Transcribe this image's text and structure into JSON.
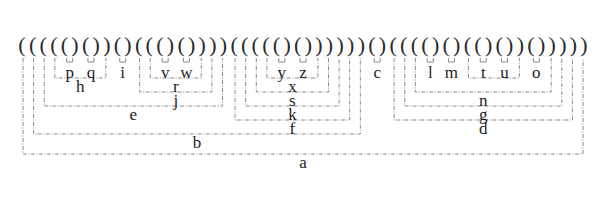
{
  "diagram": {
    "type": "parenthesized-tree-bracketing",
    "paren_string": "((((()())()((()())))((((()()))))))()((()()(()())(()))))",
    "leaves": [
      "p",
      "q",
      "i",
      "v",
      "w",
      "y",
      "z",
      "c",
      "l",
      "m",
      "t",
      "u",
      "o"
    ],
    "internal_nodes": [
      "h",
      "r",
      "j",
      "e",
      "x",
      "s",
      "k",
      "f",
      "b",
      "n",
      "g",
      "d",
      "a"
    ],
    "tree": {
      "label": "a",
      "children": [
        {
          "label": "b",
          "children": [
            {
              "label": "e",
              "children": [
                {
                  "label": "h",
                  "children": [
                    {
                      "label": "p"
                    },
                    {
                      "label": "q"
                    }
                  ]
                },
                {
                  "label": "i"
                },
                {
                  "label": "j",
                  "children": [
                    {
                      "label": "r",
                      "children": [
                        {
                          "label": "v"
                        },
                        {
                          "label": "w"
                        }
                      ]
                    }
                  ]
                }
              ]
            },
            {
              "label": "f",
              "children": [
                {
                  "label": "k",
                  "children": [
                    {
                      "label": "s",
                      "children": [
                        {
                          "label": "x",
                          "children": [
                            {
                              "label": "y"
                            },
                            {
                              "label": "z"
                            }
                          ]
                        }
                      ]
                    }
                  ]
                }
              ]
            }
          ]
        },
        {
          "label": "c"
        },
        {
          "label": "d",
          "children": [
            {
              "label": "g",
              "children": [
                {
                  "label": "n",
                  "children": [
                    {
                      "label": "l"
                    },
                    {
                      "label": "m"
                    },
                    {
                      "label": "t_u_group",
                      "hidden": true,
                      "children": [
                        {
                          "label": "t"
                        },
                        {
                          "label": "u"
                        }
                      ]
                    },
                    {
                      "label": "o"
                    }
                  ]
                }
              ]
            }
          ]
        }
      ]
    },
    "colors": {
      "paren": "#2a2a2a",
      "label": "#1e1e1e",
      "bracket": "#8a8a8a",
      "background": "#ffffff"
    }
  }
}
